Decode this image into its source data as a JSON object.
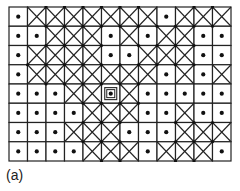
{
  "figure": {
    "label": "(a)",
    "rows": 8,
    "cols": 12,
    "legend": {
      "D": "dot cell",
      "X": "crossed cell",
      "S": "selected dot cell (double-square marker)"
    },
    "cells": [
      [
        "D",
        "X",
        "X",
        "X",
        "X",
        "X",
        "X",
        "X",
        "D",
        "X",
        "X",
        "X"
      ],
      [
        "D",
        "D",
        "X",
        "X",
        "X",
        "D",
        "X",
        "D",
        "X",
        "X",
        "D",
        "D"
      ],
      [
        "D",
        "X",
        "X",
        "X",
        "X",
        "D",
        "D",
        "X",
        "X",
        "X",
        "D",
        "D"
      ],
      [
        "D",
        "X",
        "X",
        "X",
        "X",
        "X",
        "X",
        "X",
        "D",
        "X",
        "D",
        "X"
      ],
      [
        "D",
        "D",
        "D",
        "X",
        "X",
        "S",
        "X",
        "D",
        "D",
        "D",
        "D",
        "D"
      ],
      [
        "D",
        "D",
        "D",
        "D",
        "X",
        "X",
        "X",
        "D",
        "D",
        "X",
        "D",
        "D"
      ],
      [
        "D",
        "D",
        "D",
        "X",
        "X",
        "X",
        "D",
        "D",
        "D",
        "X",
        "X",
        "X"
      ],
      [
        "D",
        "D",
        "D",
        "D",
        "X",
        "X",
        "X",
        "D",
        "X",
        "X",
        "X",
        "D"
      ]
    ],
    "colors": {
      "line": "#222222",
      "dot": "#111111",
      "background": "#ffffff"
    }
  }
}
